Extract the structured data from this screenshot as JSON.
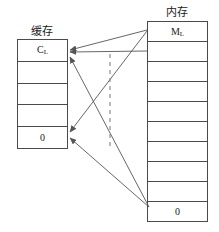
{
  "diagram": {
    "title_cache": "缓存",
    "title_memory": "内存",
    "cache": {
      "name": "缓存",
      "cells": [
        {
          "text": "C",
          "sub": "L"
        },
        {
          "text": "",
          "sub": ""
        },
        {
          "text": "",
          "sub": ""
        },
        {
          "text": "",
          "sub": ""
        },
        {
          "text": "0",
          "sub": ""
        }
      ]
    },
    "memory": {
      "name": "内存",
      "cells": [
        {
          "text": "M",
          "sub": "L"
        },
        {
          "text": "",
          "sub": ""
        },
        {
          "text": "",
          "sub": ""
        },
        {
          "text": "",
          "sub": ""
        },
        {
          "text": "",
          "sub": ""
        },
        {
          "text": "",
          "sub": ""
        },
        {
          "text": "",
          "sub": ""
        },
        {
          "text": "",
          "sub": ""
        },
        {
          "text": "",
          "sub": ""
        },
        {
          "text": "0",
          "sub": ""
        }
      ]
    },
    "colors": {
      "stroke": "#4a4a4a",
      "arrow": "#555555",
      "dash": "#777777",
      "text": "#1a1a1a",
      "background": "#ffffff"
    },
    "arrows": [
      {
        "name": "memory-top-to-cache-top-upper",
        "x1": 147,
        "y1": 30,
        "x2": 70,
        "y2": 50
      },
      {
        "name": "memory-top-to-cache-top-lower",
        "x1": 147,
        "y1": 51,
        "x2": 70,
        "y2": 52
      },
      {
        "name": "memory-top-to-cache-bottom",
        "x1": 147,
        "y1": 31,
        "x2": 70,
        "y2": 132
      },
      {
        "name": "memory-bottom-to-cache-top",
        "x1": 149,
        "y1": 207,
        "x2": 70,
        "y2": 57
      },
      {
        "name": "memory-bottom-to-cache-bottom",
        "x1": 149,
        "y1": 207,
        "x2": 70,
        "y2": 138
      }
    ],
    "divider": {
      "name": "dashed-divider",
      "x": 110,
      "y1": 54,
      "y2": 146
    }
  }
}
